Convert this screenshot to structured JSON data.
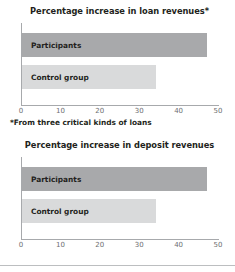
{
  "footnote": "*From three critical kinds of loans",
  "axis": {
    "ticks": [
      "0",
      "10",
      "20",
      "30",
      "40",
      "50"
    ],
    "tick_values": [
      0,
      10,
      20,
      30,
      40,
      50
    ],
    "min": 0,
    "max": 50
  },
  "colors": {
    "participants_bar": "#a8a9ab",
    "control_bar": "#d9dadb",
    "axis_line": "#a7a9ac",
    "text": "#231f20",
    "tick_text": "#6d6e71"
  },
  "charts": [
    {
      "title": "Percentage increase in loan revenues*",
      "bars": [
        {
          "label": "Participants",
          "value": 47
        },
        {
          "label": "Control group",
          "value": 34
        }
      ]
    },
    {
      "title": "Percentage increase in deposit revenues",
      "bars": [
        {
          "label": "Participants",
          "value": 47
        },
        {
          "label": "Control group",
          "value": 34
        }
      ]
    }
  ],
  "chart_data": [
    {
      "type": "bar",
      "orientation": "horizontal",
      "title": "Percentage increase in loan revenues*",
      "xlabel": "",
      "ylabel": "",
      "categories": [
        "Participants",
        "Control group"
      ],
      "values": [
        47,
        34
      ],
      "xlim": [
        0,
        50
      ],
      "xticks": [
        0,
        10,
        20,
        30,
        40,
        50
      ],
      "grid": false,
      "legend": "none",
      "annotations": [
        "*From three critical kinds of loans"
      ]
    },
    {
      "type": "bar",
      "orientation": "horizontal",
      "title": "Percentage increase in deposit revenues",
      "xlabel": "",
      "ylabel": "",
      "categories": [
        "Participants",
        "Control group"
      ],
      "values": [
        47,
        34
      ],
      "xlim": [
        0,
        50
      ],
      "xticks": [
        0,
        10,
        20,
        30,
        40,
        50
      ],
      "grid": false,
      "legend": "none"
    }
  ]
}
